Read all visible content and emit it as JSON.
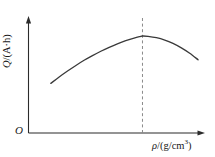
{
  "chart_data": {
    "type": "line",
    "title": "",
    "xlabel": "ρ/(g/cm³)",
    "ylabel": "Q/(A·h)",
    "origin_label": "O",
    "grid": false,
    "legend": null,
    "xlim": [
      0,
      1
    ],
    "ylim": [
      0,
      1
    ],
    "xticks": [],
    "yticks": [],
    "xticklabels": [],
    "yticklabels": [],
    "series": [
      {
        "name": "Q vs rho",
        "style": "solid",
        "color": "#3a3a3a",
        "x": [
          0.136,
          0.187,
          0.238,
          0.289,
          0.339,
          0.39,
          0.441,
          0.492,
          0.542,
          0.593,
          0.644,
          0.678,
          0.695,
          0.729,
          0.78,
          0.831,
          0.881,
          0.932,
          0.983,
          1.034
        ],
        "y": [
          0.443,
          0.5,
          0.553,
          0.603,
          0.649,
          0.691,
          0.73,
          0.765,
          0.796,
          0.824,
          0.848,
          0.861,
          0.866,
          0.863,
          0.851,
          0.83,
          0.8,
          0.76,
          0.712,
          0.654
        ]
      }
    ],
    "annotations": [
      {
        "type": "vertical-reference-line",
        "name": "peak-reference-line",
        "style": "dashed",
        "color": "#8a8a8a",
        "x": 0.695,
        "label": ""
      }
    ],
    "axes": {
      "x_axis_name": "x-axis",
      "y_axis_name": "y-axis",
      "arrowheads": true
    }
  },
  "labels": {
    "y_axis_quantity": "Q",
    "y_axis_unit": "A·h",
    "y_axis_sep": "/(",
    "y_axis_close": ")",
    "x_axis_quantity": "ρ",
    "x_axis_unit_num": "g/cm",
    "x_axis_unit_exp": "3",
    "x_axis_sep": "/(",
    "x_axis_close": ")",
    "origin": "O"
  }
}
